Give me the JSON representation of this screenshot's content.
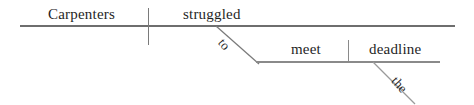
{
  "diagram": {
    "type": "reed-kellogg-sentence-diagram",
    "sentence": "Carpenters struggled to meet the deadline.",
    "line_color": "#6e6e6e",
    "text_color": "#1f1f1f",
    "background_color": "#ffffff",
    "words": {
      "subject": "Carpenters",
      "verb": "struggled",
      "infinitive_marker": "to",
      "infinitive_verb": "meet",
      "article": "the",
      "direct_object": "deadline"
    },
    "lines": [
      {
        "name": "main-baseline",
        "orientation": "horizontal",
        "x1": 20,
        "y1": 26,
        "x2": 455,
        "y2": 26
      },
      {
        "name": "subject-verb-divider",
        "orientation": "vertical",
        "x1": 148,
        "y1": 8,
        "x2": 148,
        "y2": 45
      },
      {
        "name": "infinitive-slant-line",
        "orientation": "diagonal",
        "x1": 216,
        "y1": 26,
        "x2": 258,
        "y2": 63
      },
      {
        "name": "infinitive-baseline",
        "orientation": "horizontal",
        "x1": 256,
        "y1": 62,
        "x2": 440,
        "y2": 62
      },
      {
        "name": "verb-object-divider",
        "orientation": "vertical",
        "x1": 348,
        "y1": 40,
        "x2": 348,
        "y2": 62
      },
      {
        "name": "article-slant-line",
        "orientation": "diagonal",
        "x1": 373,
        "y1": 62,
        "x2": 414,
        "y2": 103
      }
    ]
  }
}
